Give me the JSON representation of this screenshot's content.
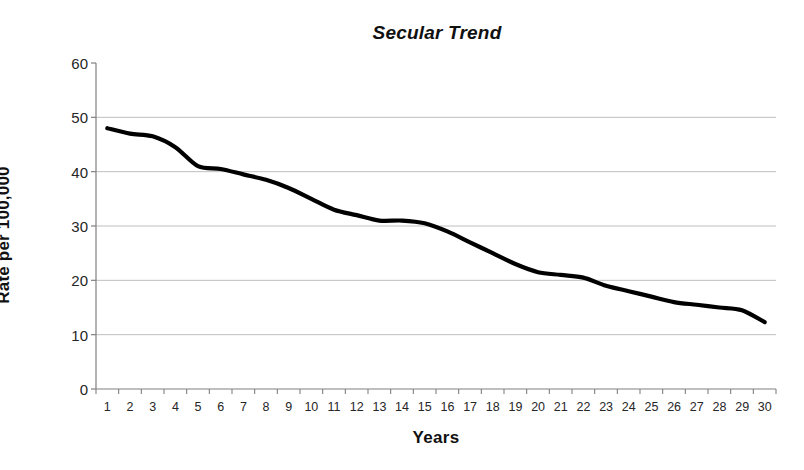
{
  "chart_data": {
    "type": "line",
    "title": "Secular Trend",
    "xlabel": "Years",
    "ylabel": "Rate per 100,000",
    "categories": [
      "1",
      "2",
      "3",
      "4",
      "5",
      "6",
      "7",
      "8",
      "9",
      "10",
      "11",
      "12",
      "13",
      "14",
      "15",
      "16",
      "17",
      "18",
      "19",
      "20",
      "21",
      "22",
      "23",
      "24",
      "25",
      "26",
      "27",
      "28",
      "29",
      "30"
    ],
    "values": [
      48,
      47,
      46.5,
      44.5,
      41,
      40.5,
      39.5,
      38.5,
      37,
      35,
      33,
      32,
      31,
      31,
      30.5,
      29,
      27,
      25,
      23,
      21.5,
      21,
      20.5,
      19,
      18,
      17,
      16,
      15.5,
      15,
      14.5,
      12.3
    ],
    "series": [
      {
        "name": "Rate",
        "values": [
          48,
          47,
          46.5,
          44.5,
          41,
          40.5,
          39.5,
          38.5,
          37,
          35,
          33,
          32,
          31,
          31,
          30.5,
          29,
          27,
          25,
          23,
          21.5,
          21,
          20.5,
          19,
          18,
          17,
          16,
          15.5,
          15,
          14.5,
          12.3
        ]
      }
    ],
    "ylim": [
      0,
      60
    ],
    "yticks": [
      0,
      10,
      20,
      30,
      40,
      50,
      60
    ],
    "ytick_labels": [
      "0",
      "10",
      "20",
      "30",
      "40",
      "50",
      "60"
    ],
    "grid": "horizontal",
    "legend": "none",
    "line_color": "#000000",
    "gridline_color": "#BFBFBF",
    "axis_color": "#808080",
    "background_color": "#FFFFFF"
  }
}
